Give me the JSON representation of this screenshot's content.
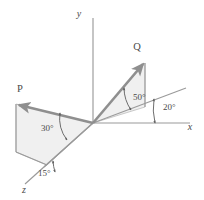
{
  "figure": {
    "kind": "3d-vector-diagram",
    "background_color": "#ffffff",
    "axes": [
      {
        "id": "y",
        "label": "y",
        "direction": "up"
      },
      {
        "id": "x",
        "label": "x",
        "direction": "right"
      },
      {
        "id": "z",
        "label": "z",
        "direction": "lower-left"
      }
    ],
    "vectors": [
      {
        "id": "P",
        "label": "P",
        "direction": "upper-left"
      },
      {
        "id": "Q",
        "label": "Q",
        "direction": "upper-right"
      }
    ],
    "angles": [
      {
        "id": "angle-q-elevation",
        "label": "50°",
        "value": 50,
        "unit": "degrees",
        "between": "Q and its horizontal projection"
      },
      {
        "id": "angle-q-azimuth",
        "label": "20°",
        "value": 20,
        "unit": "degrees",
        "between": "Q horizontal projection and x axis"
      },
      {
        "id": "angle-p-elevation",
        "label": "30°",
        "value": 30,
        "unit": "degrees",
        "between": "P and its horizontal projection"
      },
      {
        "id": "angle-p-azimuth",
        "label": "15°",
        "value": 15,
        "unit": "degrees",
        "between": "P horizontal projection and z axis"
      }
    ],
    "colors": {
      "vector": "#8f8f8f",
      "axis": "#9a9a9a",
      "plane": "#ededed",
      "plane_edge": "#b4b4b4",
      "arc": "#5d5d5d",
      "text": "#4a4a4a"
    }
  }
}
